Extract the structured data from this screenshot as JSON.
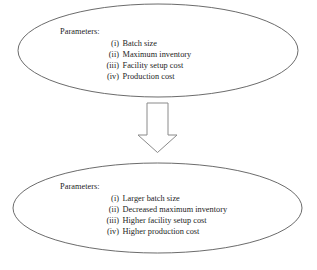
{
  "diagram": {
    "background_color": "#ffffff",
    "stroke_color": "#5a5a5a",
    "text_color": "#1d1d1d",
    "arrow_icon": "down-block-arrow-icon",
    "top_node": {
      "shape": "ellipse",
      "heading": "Parameters:",
      "items": [
        {
          "numeral": "(i)",
          "label": "Batch size"
        },
        {
          "numeral": "(ii)",
          "label": "Maximum inventory"
        },
        {
          "numeral": "(iii)",
          "label": "Facility setup cost"
        },
        {
          "numeral": "(iv)",
          "label": "Production cost"
        }
      ]
    },
    "bottom_node": {
      "shape": "ellipse",
      "heading": "Parameters:",
      "items": [
        {
          "numeral": "(i)",
          "label": "Larger batch size"
        },
        {
          "numeral": "(ii)",
          "label": "Decreased maximum inventory"
        },
        {
          "numeral": "(iii)",
          "label": "Higher facility setup cost"
        },
        {
          "numeral": "(iv)",
          "label": "Higher production cost"
        }
      ]
    }
  }
}
